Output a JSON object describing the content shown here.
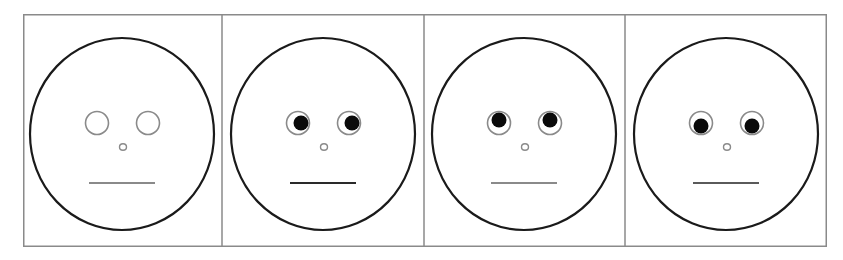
{
  "figure": {
    "panel_count": 4,
    "colors": {
      "background": "#ffffff",
      "frame": "#8a8a8a",
      "face_outline": "#1a1a1a",
      "eye_outline": "#8a8a8a",
      "pupil": "#0a0a0a",
      "mouth_neutral_gray": "#8a8a8a",
      "mouth_dark": "#2a2a2a"
    }
  },
  "panels": [
    {
      "id": "panel-1",
      "gaze": "none",
      "pupils_visible": false,
      "pupil_dx": 0,
      "pupil_dy": 0,
      "mouth_color": "#8a8a8a"
    },
    {
      "id": "panel-2",
      "gaze": "right",
      "pupils_visible": true,
      "pupil_dx": 3,
      "pupil_dy": 0,
      "mouth_color": "#2a2a2a"
    },
    {
      "id": "panel-3",
      "gaze": "up",
      "pupils_visible": true,
      "pupil_dx": 0,
      "pupil_dy": -3,
      "mouth_color": "#8a8a8a"
    },
    {
      "id": "panel-4",
      "gaze": "down",
      "pupils_visible": true,
      "pupil_dx": 0,
      "pupil_dy": 3,
      "mouth_color": "#5a5a5a"
    }
  ]
}
